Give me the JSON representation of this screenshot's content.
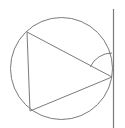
{
  "diagram": {
    "type": "geometry",
    "stroke_color": "#7a7a7a",
    "background": "#ffffff",
    "circle": {
      "cx": 61.5,
      "cy": 68.5,
      "r": 51
    },
    "triangle": {
      "vertices": [
        {
          "name": "top-left",
          "x": 27,
          "y": 32
        },
        {
          "name": "bottom-left",
          "x": 30,
          "y": 111
        },
        {
          "name": "right",
          "x": 112,
          "y": 77
        }
      ]
    },
    "tangent_line": {
      "x1": 113.5,
      "y1": 9,
      "x2": 113.5,
      "y2": 128
    },
    "angle_arc": {
      "cx": 112,
      "cy": 77,
      "r": 24,
      "from_deg": 205,
      "to_deg": 270
    }
  }
}
